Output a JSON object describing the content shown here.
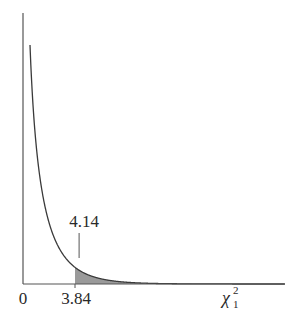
{
  "chart_data": {
    "type": "line",
    "title": "",
    "xlabel": "χ²₁",
    "xlabel_base": "χ",
    "xlabel_sup": "2",
    "xlabel_sub": "1",
    "ylabel": "",
    "distribution": "chi-square density, 1 degree of freedom",
    "x_ticks": [
      {
        "value": 0,
        "label": "0"
      },
      {
        "value": 3.84,
        "label": "3.84"
      }
    ],
    "critical_value": 3.84,
    "shaded_region": {
      "from": 3.84,
      "to": "infinity",
      "meaning": "rejection region (upper tail)"
    },
    "annotation": {
      "value": 4.14,
      "label": "4.14",
      "type": "marker line above curve"
    },
    "xlim": [
      0,
      19
    ],
    "grid": false,
    "legend": null,
    "colors": {
      "curve": "#3a3a3a",
      "axis": "#555555",
      "shade": "#9a9a9a",
      "text": "#2a2a2a"
    }
  }
}
